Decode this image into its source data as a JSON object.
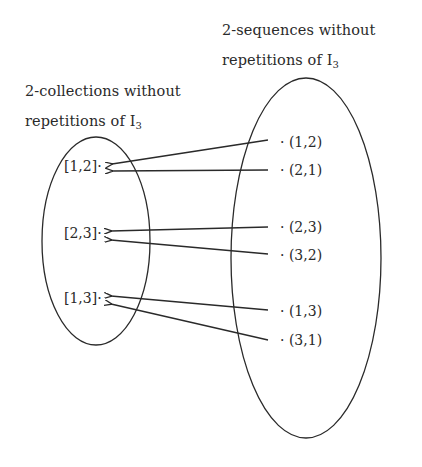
{
  "right_set": {
    "title_line1": "2-sequences  without",
    "title_line2_prefix": "repetitions of I",
    "title_line2_sub": "3",
    "elements": [
      {
        "label": "(1,2)",
        "y": 142
      },
      {
        "label": "(2,1)",
        "y": 170
      },
      {
        "label": "(2,3)",
        "y": 227
      },
      {
        "label": "(3,2)",
        "y": 255
      },
      {
        "label": "(1,3)",
        "y": 311
      },
      {
        "label": "(3,1)",
        "y": 340
      }
    ]
  },
  "left_set": {
    "title_line1": "2-collections without",
    "title_line2_prefix": "repetitions of I",
    "title_line2_sub": "3",
    "elements": [
      {
        "label": "[1,2]",
        "y": 166
      },
      {
        "label": "[2,3]",
        "y": 233
      },
      {
        "label": "[1,3]",
        "y": 298
      }
    ]
  },
  "mapping": [
    {
      "from": "(1,2)",
      "to": "[1,2]"
    },
    {
      "from": "(2,1)",
      "to": "[1,2]"
    },
    {
      "from": "(2,3)",
      "to": "[2,3]"
    },
    {
      "from": "(3,2)",
      "to": "[2,3]"
    },
    {
      "from": "(1,3)",
      "to": "[1,3]"
    },
    {
      "from": "(3,1)",
      "to": "[1,3]"
    }
  ],
  "dot_symbol": "·",
  "colors": {
    "ink": "#2a2a2a",
    "background": "#ffffff"
  }
}
